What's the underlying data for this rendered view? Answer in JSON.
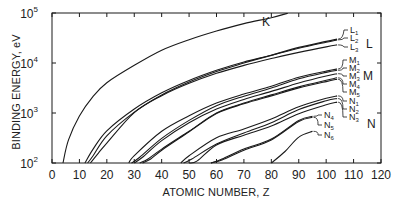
{
  "chart_data": {
    "type": "line",
    "title": "",
    "xlabel": "ATOMIC NUMBER, Z",
    "ylabel": "BINDING ENERGY, eV",
    "xlim": [
      0,
      120
    ],
    "ylim": [
      100,
      100000
    ],
    "yscale": "log",
    "grid": false,
    "legend": "inline labels at right end of curves",
    "x_ticks": [
      0,
      10,
      20,
      30,
      40,
      50,
      60,
      70,
      80,
      90,
      100,
      110,
      120
    ],
    "y_ticks": [
      {
        "base": "10",
        "exp": "2",
        "value": 100
      },
      {
        "base": "10",
        "exp": "3",
        "value": 1000
      },
      {
        "base": "10",
        "exp": "4",
        "value": 10000
      },
      {
        "base": "10",
        "exp": "5",
        "value": 100000
      }
    ],
    "shell_labels": [
      "K",
      "L",
      "M",
      "N"
    ],
    "series": [
      {
        "name": "K",
        "shell": "K",
        "points": [
          [
            4,
            100
          ],
          [
            6,
            290
          ],
          [
            10,
            870
          ],
          [
            15,
            2150
          ],
          [
            20,
            4040
          ],
          [
            30,
            8980
          ],
          [
            40,
            18000
          ],
          [
            50,
            29200
          ],
          [
            60,
            43600
          ],
          [
            70,
            61300
          ],
          [
            80,
            80700
          ],
          [
            86,
            99000
          ]
        ]
      },
      {
        "name": "L1",
        "shell": "L",
        "points": [
          [
            12,
            100
          ],
          [
            15,
            190
          ],
          [
            20,
            440
          ],
          [
            30,
            1200
          ],
          [
            40,
            2530
          ],
          [
            50,
            4470
          ],
          [
            60,
            7130
          ],
          [
            70,
            10490
          ],
          [
            80,
            14350
          ],
          [
            90,
            20470
          ],
          [
            100,
            27000
          ],
          [
            104,
            30000
          ]
        ]
      },
      {
        "name": "L2",
        "shell": "L",
        "points": [
          [
            13,
            100
          ],
          [
            15,
            140
          ],
          [
            20,
            350
          ],
          [
            30,
            1040
          ],
          [
            40,
            2300
          ],
          [
            50,
            4160
          ],
          [
            60,
            6720
          ],
          [
            70,
            9980
          ],
          [
            80,
            14210
          ],
          [
            90,
            19690
          ],
          [
            100,
            26100
          ],
          [
            104,
            29000
          ]
        ]
      },
      {
        "name": "L3",
        "shell": "L",
        "points": [
          [
            14,
            100
          ],
          [
            17,
            160
          ],
          [
            20,
            250
          ],
          [
            30,
            1020
          ],
          [
            40,
            2220
          ],
          [
            50,
            3930
          ],
          [
            60,
            6210
          ],
          [
            70,
            8950
          ],
          [
            80,
            12280
          ],
          [
            90,
            16300
          ],
          [
            100,
            21000
          ],
          [
            104,
            23000
          ]
        ]
      },
      {
        "name": "M1",
        "shell": "M",
        "points": [
          [
            28,
            100
          ],
          [
            30,
            140
          ],
          [
            40,
            430
          ],
          [
            50,
            880
          ],
          [
            60,
            1580
          ],
          [
            70,
            2400
          ],
          [
            80,
            3430
          ],
          [
            90,
            5180
          ],
          [
            100,
            6900
          ],
          [
            104,
            7600
          ]
        ]
      },
      {
        "name": "M2",
        "shell": "M",
        "points": [
          [
            29,
            100
          ],
          [
            32,
            130
          ],
          [
            40,
            310
          ],
          [
            50,
            710
          ],
          [
            60,
            1400
          ],
          [
            70,
            2170
          ],
          [
            80,
            3150
          ],
          [
            90,
            4830
          ],
          [
            100,
            6500
          ],
          [
            104,
            7150
          ]
        ]
      },
      {
        "name": "M3",
        "shell": "M",
        "points": [
          [
            30,
            100
          ],
          [
            33,
            130
          ],
          [
            40,
            280
          ],
          [
            50,
            640
          ],
          [
            60,
            1200
          ],
          [
            70,
            1860
          ],
          [
            80,
            2700
          ],
          [
            90,
            3980
          ],
          [
            100,
            5500
          ],
          [
            104,
            6100
          ]
        ]
      },
      {
        "name": "M4",
        "shell": "M",
        "points": [
          [
            32,
            100
          ],
          [
            35,
            120
          ],
          [
            40,
            190
          ],
          [
            50,
            430
          ],
          [
            60,
            1000
          ],
          [
            70,
            1580
          ],
          [
            80,
            2300
          ],
          [
            90,
            3330
          ],
          [
            100,
            4500
          ],
          [
            104,
            5050
          ]
        ]
      },
      {
        "name": "M5",
        "shell": "M",
        "points": [
          [
            33,
            100
          ],
          [
            36,
            120
          ],
          [
            40,
            180
          ],
          [
            50,
            420
          ],
          [
            60,
            980
          ],
          [
            70,
            1530
          ],
          [
            80,
            2200
          ],
          [
            90,
            3180
          ],
          [
            100,
            4250
          ],
          [
            104,
            4750
          ]
        ]
      },
      {
        "name": "N1",
        "shell": "N",
        "points": [
          [
            47,
            100
          ],
          [
            50,
            140
          ],
          [
            60,
            320
          ],
          [
            70,
            480
          ],
          [
            80,
            760
          ],
          [
            90,
            1330
          ],
          [
            100,
            1970
          ],
          [
            104,
            2200
          ]
        ]
      },
      {
        "name": "N2",
        "shell": "N",
        "points": [
          [
            48,
            100
          ],
          [
            51,
            120
          ],
          [
            60,
            240
          ],
          [
            70,
            400
          ],
          [
            80,
            640
          ],
          [
            90,
            1170
          ],
          [
            100,
            1760
          ],
          [
            104,
            1950
          ]
        ]
      },
      {
        "name": "N3",
        "shell": "N",
        "points": [
          [
            50,
            100
          ],
          [
            53,
            110
          ],
          [
            60,
            230
          ],
          [
            70,
            360
          ],
          [
            80,
            550
          ],
          [
            90,
            970
          ],
          [
            100,
            1460
          ],
          [
            104,
            1650
          ]
        ]
      },
      {
        "name": "N4",
        "shell": "N",
        "points": [
          [
            58,
            100
          ],
          [
            62,
            120
          ],
          [
            70,
            190
          ],
          [
            80,
            300
          ],
          [
            90,
            710
          ],
          [
            95,
            860
          ]
        ]
      },
      {
        "name": "N5",
        "shell": "N",
        "points": [
          [
            58,
            100
          ],
          [
            62,
            115
          ],
          [
            70,
            180
          ],
          [
            80,
            290
          ],
          [
            90,
            680
          ],
          [
            95,
            820
          ]
        ]
      },
      {
        "name": "N6",
        "shell": "N",
        "points": [
          [
            80,
            100
          ],
          [
            85,
            170
          ],
          [
            90,
            330
          ],
          [
            95,
            430
          ]
        ]
      }
    ]
  },
  "labels": {
    "K": "K",
    "L": "L",
    "M": "M",
    "N": "N",
    "sub_L": [
      "L",
      "L",
      "L"
    ],
    "sub_L_idx": [
      "1",
      "2",
      "3"
    ],
    "sub_M": [
      "M",
      "M",
      "M",
      "M",
      "M"
    ],
    "sub_M_idx": [
      "1",
      "2",
      "3",
      "4",
      "5"
    ],
    "sub_N": [
      "N",
      "N",
      "N"
    ],
    "sub_N_idx": [
      "1",
      "2",
      "3"
    ],
    "sub_N2": [
      "N",
      "N",
      "N"
    ],
    "sub_N2_idx": [
      "4",
      "5",
      "6"
    ]
  }
}
